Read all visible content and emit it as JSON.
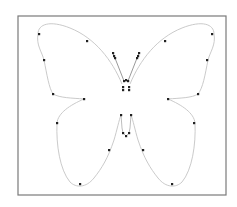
{
  "diagram": {
    "type": "bezier-outline",
    "frame": {
      "x": 18,
      "y": 16,
      "width": 208,
      "height": 179
    },
    "colors": {
      "frame": "#7a7a7a",
      "outline": "#c4c4c4",
      "antenna": "#9a9a9a",
      "control_point": "#222222",
      "background": "#ffffff"
    },
    "outline_paths": [
      {
        "name": "left-upper-wing",
        "d": "M122,84 C112,60 95,38 70,28 C50,20 38,24 38,34 C36,45 42,52 44,60 C47,75 49,88 53,94 C60,98 72,98 84,99"
      },
      {
        "name": "left-lower-wing",
        "d": "M84,99 C70,105 58,113 57,123 C56,145 60,170 70,182 C76,188 86,188 94,178 C102,168 108,158 114,140 C117,130 119,120 121,115"
      },
      {
        "name": "right-upper-wing",
        "d": "M130,84 C140,60 157,38 182,28 C202,20 214,24 214,34 C216,45 210,52 208,60 C205,75 203,88 198,94 C192,98 180,98 168,99"
      },
      {
        "name": "right-lower-wing",
        "d": "M168,99 C182,105 194,113 195,123 C196,145 192,170 182,182 C176,188 166,188 158,178 C150,168 144,158 138,140 C135,130 133,120 131,115"
      }
    ],
    "antennae": [
      {
        "name": "left-antenna",
        "d": "M113,53 L124,81"
      },
      {
        "name": "right-antenna",
        "d": "M139,53 L128,81"
      }
    ],
    "body_paths": [
      {
        "name": "abdomen-left",
        "d": "M121,115 L122,128 L123,133 L126,136"
      },
      {
        "name": "abdomen-right",
        "d": "M131,115 L130,128 L129,133 L126,136"
      },
      {
        "name": "thorax",
        "d": "M124,81 L128,81"
      }
    ],
    "control_points": [
      [
        39,
        34
      ],
      [
        87,
        41
      ],
      [
        44,
        60
      ],
      [
        53,
        94
      ],
      [
        84,
        99
      ],
      [
        57,
        123
      ],
      [
        109,
        150
      ],
      [
        80,
        184
      ],
      [
        212,
        34
      ],
      [
        165,
        41
      ],
      [
        207,
        60
      ],
      [
        198,
        94
      ],
      [
        168,
        99
      ],
      [
        194,
        123
      ],
      [
        143,
        150
      ],
      [
        172,
        184
      ],
      [
        113,
        53
      ],
      [
        114,
        56
      ],
      [
        115,
        58
      ],
      [
        139,
        53
      ],
      [
        138,
        56
      ],
      [
        137,
        58
      ],
      [
        124,
        81
      ],
      [
        126,
        80
      ],
      [
        128,
        81
      ],
      [
        123,
        87
      ],
      [
        123,
        90
      ],
      [
        129,
        87
      ],
      [
        129,
        90
      ],
      [
        121,
        115
      ],
      [
        131,
        115
      ],
      [
        123,
        133
      ],
      [
        126,
        136
      ],
      [
        129,
        133
      ]
    ]
  }
}
